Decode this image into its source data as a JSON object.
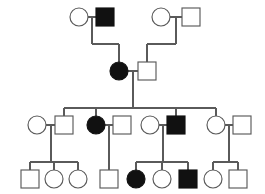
{
  "figure": {
    "kind": "pedigree-chart",
    "title": "",
    "background_color": "#ffffff",
    "line_color": "#5a5a5a",
    "affected_fill": "#111111",
    "unaffected_fill": "#ffffff",
    "width": 265,
    "height": 194,
    "legend": {
      "circle_meaning": "female",
      "square_meaning": "male",
      "filled_meaning": "affected",
      "open_meaning": "unaffected"
    }
  },
  "chart_data": {
    "type": "diagram",
    "diagram_type": "pedigree",
    "generations": [
      {
        "id": "I",
        "label": "",
        "individuals": [
          {
            "id": "I-1",
            "shape": "circle",
            "sex": "female",
            "affected": false,
            "cx": 79,
            "cy": 17,
            "r": 9
          },
          {
            "id": "I-2",
            "shape": "square",
            "sex": "male",
            "affected": true,
            "cx": 105,
            "cy": 17,
            "r": 9
          },
          {
            "id": "I-3",
            "shape": "circle",
            "sex": "female",
            "affected": false,
            "cx": 161,
            "cy": 17,
            "r": 9
          },
          {
            "id": "I-4",
            "shape": "square",
            "sex": "male",
            "affected": false,
            "cx": 191,
            "cy": 17,
            "r": 9
          }
        ],
        "matings": [
          {
            "id": "M-I-A",
            "partners": [
              "I-1",
              "I-2"
            ],
            "children": [
              "II-1"
            ]
          },
          {
            "id": "M-I-B",
            "partners": [
              "I-3",
              "I-4"
            ],
            "children": [
              "II-2"
            ]
          }
        ]
      },
      {
        "id": "II",
        "label": "",
        "individuals": [
          {
            "id": "II-1",
            "shape": "circle",
            "sex": "female",
            "affected": true,
            "cx": 119,
            "cy": 71,
            "r": 9
          },
          {
            "id": "II-2",
            "shape": "square",
            "sex": "male",
            "affected": false,
            "cx": 147,
            "cy": 71,
            "r": 9
          }
        ],
        "matings": [
          {
            "id": "M-II-A",
            "partners": [
              "II-1",
              "II-2"
            ],
            "children": [
              "III-2",
              "III-3",
              "III-6",
              "III-7"
            ]
          }
        ]
      },
      {
        "id": "III",
        "label": "",
        "individuals": [
          {
            "id": "III-1",
            "shape": "circle",
            "sex": "female",
            "affected": false,
            "cx": 37,
            "cy": 125,
            "r": 9
          },
          {
            "id": "III-2",
            "shape": "square",
            "sex": "male",
            "affected": false,
            "cx": 64,
            "cy": 125,
            "r": 9
          },
          {
            "id": "III-3",
            "shape": "circle",
            "sex": "female",
            "affected": true,
            "cx": 96,
            "cy": 125,
            "r": 9
          },
          {
            "id": "III-4",
            "shape": "square",
            "sex": "male",
            "affected": false,
            "cx": 122,
            "cy": 125,
            "r": 9
          },
          {
            "id": "III-5",
            "shape": "circle",
            "sex": "female",
            "affected": false,
            "cx": 150,
            "cy": 125,
            "r": 9
          },
          {
            "id": "III-6",
            "shape": "square",
            "sex": "male",
            "affected": true,
            "cx": 176,
            "cy": 125,
            "r": 9
          },
          {
            "id": "III-7",
            "shape": "circle",
            "sex": "female",
            "affected": false,
            "cx": 216,
            "cy": 125,
            "r": 9
          },
          {
            "id": "III-8",
            "shape": "square",
            "sex": "male",
            "affected": false,
            "cx": 242,
            "cy": 125,
            "r": 9
          }
        ],
        "matings": [
          {
            "id": "M-III-A",
            "partners": [
              "III-1",
              "III-2"
            ],
            "children": [
              "IV-1",
              "IV-2",
              "IV-3"
            ]
          },
          {
            "id": "M-III-B",
            "partners": [
              "III-3",
              "III-4"
            ],
            "children": [
              "IV-4"
            ]
          },
          {
            "id": "M-III-C",
            "partners": [
              "III-5",
              "III-6"
            ],
            "children": [
              "IV-5",
              "IV-6",
              "IV-7"
            ]
          },
          {
            "id": "M-III-D",
            "partners": [
              "III-7",
              "III-8"
            ],
            "children": [
              "IV-8",
              "IV-9"
            ]
          }
        ]
      },
      {
        "id": "IV",
        "label": "",
        "individuals": [
          {
            "id": "IV-1",
            "shape": "square",
            "sex": "male",
            "affected": false,
            "cx": 30,
            "cy": 179,
            "r": 9
          },
          {
            "id": "IV-2",
            "shape": "circle",
            "sex": "female",
            "affected": false,
            "cx": 54,
            "cy": 179,
            "r": 9
          },
          {
            "id": "IV-3",
            "shape": "circle",
            "sex": "female",
            "affected": false,
            "cx": 78,
            "cy": 179,
            "r": 9
          },
          {
            "id": "IV-4",
            "shape": "square",
            "sex": "male",
            "affected": false,
            "cx": 109,
            "cy": 179,
            "r": 9
          },
          {
            "id": "IV-5",
            "shape": "circle",
            "sex": "female",
            "affected": true,
            "cx": 136,
            "cy": 179,
            "r": 9
          },
          {
            "id": "IV-6",
            "shape": "circle",
            "sex": "female",
            "affected": false,
            "cx": 162,
            "cy": 179,
            "r": 9
          },
          {
            "id": "IV-7",
            "shape": "square",
            "sex": "male",
            "affected": true,
            "cx": 188,
            "cy": 179,
            "r": 9
          },
          {
            "id": "IV-8",
            "shape": "circle",
            "sex": "female",
            "affected": false,
            "cx": 213,
            "cy": 179,
            "r": 9
          },
          {
            "id": "IV-9",
            "shape": "square",
            "sex": "male",
            "affected": false,
            "cx": 238,
            "cy": 179,
            "r": 9
          }
        ],
        "matings": []
      }
    ],
    "counts": {
      "total_individuals": 23,
      "affected_total": 6,
      "affected_males": 3,
      "affected_females": 3,
      "generations": 4
    }
  },
  "connectors": {
    "gen_I_A_mating_y": 17,
    "gen_I_B_mating_y": 17,
    "gen_I_A_drop_x": 92,
    "gen_I_B_drop_x": 176,
    "gen_I_child_bar_y": 44,
    "gen_II_mating_y": 71,
    "gen_II_drop_x": 133,
    "gen_III_sib_bar_y": 108,
    "gen_III_sib_bar_x1": 64,
    "gen_III_sib_bar_x2": 216,
    "gen_IV_sib_bar_y": 162
  }
}
